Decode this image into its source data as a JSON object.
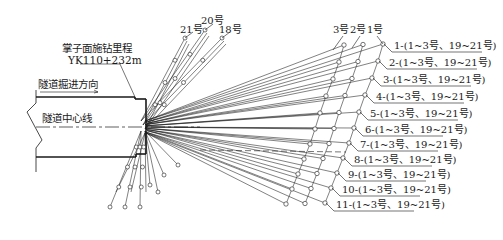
{
  "diagram": {
    "face_label_line1": "掌子面施钻里程",
    "face_label_line2": "YK110+232m",
    "direction_label": "隧道掘进方向",
    "centerline_label": "隧道中心线",
    "top_hole_labels": [
      "21号",
      "20号",
      "18号"
    ],
    "right_top_labels": [
      "3号",
      "2号",
      "1号"
    ],
    "section_labels": [
      "1-(1~3号、19~21号)",
      "2-(1~3号、19~21号)",
      "3-(1~3号、19~21号)",
      "4-(1~3号、19~21号)",
      "5-(1~3号、19~21号)",
      "6-(1~3号、19~21号)",
      "7-(1~3号、19~21号)",
      "8-(1~3号、19~21号)",
      "9-(1~3号、19~21号)",
      "10-(1~3号、19~21号)",
      "11-(1~3号、19~21号)"
    ],
    "line_color": "#1a1a1a",
    "background": "#ffffff"
  }
}
